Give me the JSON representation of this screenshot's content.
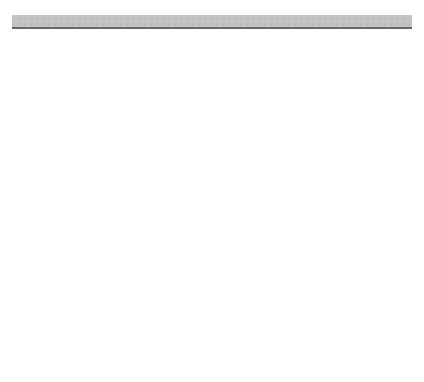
{
  "diagram": {
    "type": "pulley-system",
    "tension_label": "T",
    "ceiling_color": "#bdbdbd",
    "rope_color": "#9a9a9a",
    "block_color": "#4a4a4a",
    "pulleys": [
      {
        "id": "p1",
        "cx": 53,
        "cy": 213
      },
      {
        "id": "p2",
        "cx": 104,
        "cy": 98
      },
      {
        "id": "p3",
        "cx": 154,
        "cy": 165
      },
      {
        "id": "p4",
        "cx": 205,
        "cy": 60
      },
      {
        "id": "p5",
        "cx": 256,
        "cy": 192
      },
      {
        "id": "p6",
        "cx": 306,
        "cy": 130
      },
      {
        "id": "p7",
        "cx": 357,
        "cy": 249
      }
    ],
    "masses": [
      {
        "id": "m1",
        "label": "",
        "x": 53,
        "y": 296
      },
      {
        "id": "m2",
        "label": "5",
        "x": 104,
        "y": 321
      },
      {
        "id": "m3",
        "label": "34",
        "x": 154,
        "y": 318
      },
      {
        "id": "m4",
        "label": "6",
        "x": 205,
        "y": 269
      },
      {
        "id": "m5",
        "label": "20",
        "x": 256,
        "y": 293
      },
      {
        "id": "m6",
        "label": "15",
        "x": 306,
        "y": 336
      },
      {
        "id": "m7",
        "label": "23",
        "x": 357,
        "y": 314
      }
    ],
    "caption": "Figure 13-34  Problem 14."
  }
}
